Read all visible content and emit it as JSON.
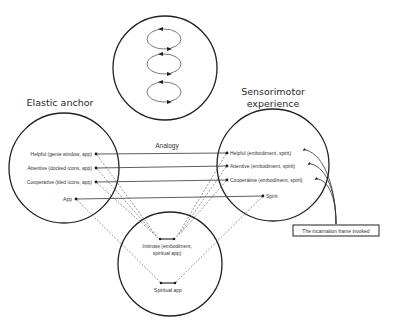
{
  "diagram": {
    "top_circle": {
      "label": "",
      "loops": 3
    },
    "left_circle": {
      "title": "Elastic anchor",
      "items": [
        {
          "label": "Helpful (genie window, app)"
        },
        {
          "label": "Attentive (docked icons, app)"
        },
        {
          "label": "Cooperative (tiled icons, app)"
        },
        {
          "label": "App"
        }
      ]
    },
    "right_circle": {
      "title_line1": "Sensorimotor",
      "title_line2": "experience",
      "items": [
        {
          "label": "Helpful (embodiment, spirit)"
        },
        {
          "label": "Attentive (embodiment, spirit)"
        },
        {
          "label": "Cooperative (embodiment, spirit)"
        },
        {
          "label": "Spirit"
        }
      ]
    },
    "bottom_circle": {
      "items": [
        {
          "label_line1": "Intimate (embodiment,",
          "label_line2": "spiritual app)"
        },
        {
          "label_line1": "Spiritual app"
        }
      ]
    },
    "connector_label": "Analogy",
    "callout_box": {
      "label": "The incarnation frame invoked"
    },
    "colors": {
      "stroke": "#222222",
      "background": "#ffffff"
    }
  }
}
